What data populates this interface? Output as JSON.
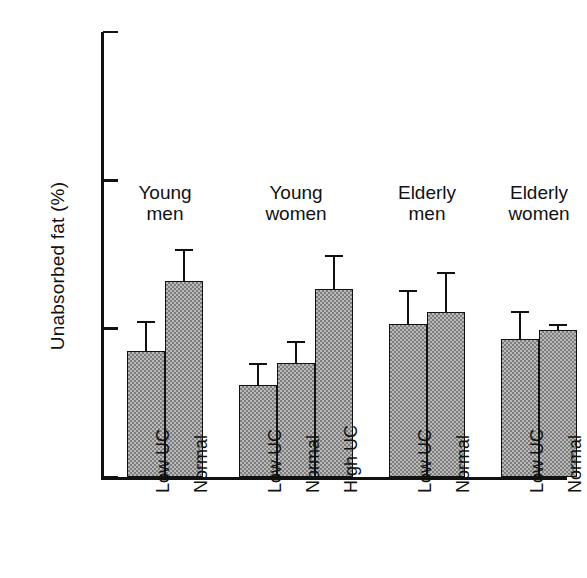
{
  "chart_data": {
    "type": "bar",
    "title": "",
    "xlabel": "",
    "ylabel": "Unabsorbed fat (%)",
    "ylim": [
      0,
      15
    ],
    "ytick_labels": [
      "0",
      "5",
      "10",
      "15"
    ],
    "ytick_values": [
      0,
      5,
      10,
      15
    ],
    "grid": false,
    "legend": "none",
    "group_labels": [
      "Young men",
      "Young women",
      "Elderly men",
      "Elderly women"
    ],
    "groups": [
      {
        "name": "Young men",
        "line1": "Young",
        "line2": "men",
        "categories": [
          "Low UC",
          "Normal"
        ],
        "values": [
          4.25,
          6.6
        ],
        "errors": [
          1.0,
          1.1
        ]
      },
      {
        "name": "Young women",
        "line1": "Young",
        "line2": "women",
        "categories": [
          "Low UC",
          "Normal",
          "High UC"
        ],
        "values": [
          3.1,
          3.85,
          6.35
        ],
        "errors": [
          0.75,
          0.75,
          1.15
        ]
      },
      {
        "name": "Elderly men",
        "line1": "Elderly",
        "line2": "men",
        "categories": [
          "Low UC",
          "Normal"
        ],
        "values": [
          5.15,
          5.55
        ],
        "errors": [
          1.15,
          1.35
        ]
      },
      {
        "name": "Elderly women",
        "line1": "Elderly",
        "line2": "women",
        "categories": [
          "Low UC",
          "Normal"
        ],
        "values": [
          4.65,
          4.95
        ],
        "errors": [
          0.95,
          0.2
        ]
      }
    ],
    "categories_flat": [
      "Low UC",
      "Normal",
      "Low UC",
      "Normal",
      "High UC",
      "Low UC",
      "Normal",
      "Low UC",
      "Normal"
    ],
    "values_flat": [
      4.25,
      6.6,
      3.1,
      3.85,
      6.35,
      5.15,
      5.55,
      4.65,
      4.95
    ],
    "errors_flat": [
      1.0,
      1.1,
      0.75,
      0.75,
      1.15,
      1.15,
      1.35,
      0.95,
      0.2
    ],
    "colors": {
      "bar_fill": "#b9b9b9",
      "bar_hatch": "#7d7d7d",
      "bar_edge": "#111111",
      "axis": "#111111",
      "background": "#ffffff"
    }
  }
}
